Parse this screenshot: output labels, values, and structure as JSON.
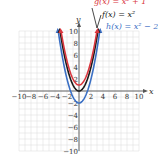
{
  "chart_data": {
    "type": "line",
    "title": "",
    "xlabel": "x",
    "ylabel": "y",
    "xlim": [
      -10,
      10
    ],
    "ylim": [
      -10,
      10
    ],
    "grid": true,
    "x_ticks": [
      "-10",
      "-8",
      "-6",
      "-4",
      "-2",
      "2",
      "4",
      "6",
      "8",
      "10"
    ],
    "y_ticks": [
      "10",
      "8",
      "6",
      "4",
      "2",
      "-2",
      "-4",
      "-6",
      "-8",
      "-10"
    ],
    "series": [
      {
        "name": "g(x) = x^2 + 1",
        "color": "#d9363e",
        "x": [
          -3,
          -2,
          -1,
          0,
          1,
          2,
          3
        ],
        "values": [
          10,
          5,
          2,
          1,
          2,
          5,
          10
        ]
      },
      {
        "name": "f(x) = x^2",
        "color": "#1a1a1a",
        "x": [
          -3,
          -2,
          -1,
          0,
          1,
          2,
          3
        ],
        "values": [
          9,
          4,
          1,
          0,
          1,
          4,
          9
        ]
      },
      {
        "name": "h(x) = x^2 - 2",
        "color": "#3a6fc4",
        "x": [
          -3,
          -2,
          -1,
          0,
          1,
          2,
          3
        ],
        "values": [
          7,
          2,
          -1,
          -2,
          -1,
          2,
          7
        ]
      }
    ]
  },
  "labels": {
    "g": "g(x) = x² + 1",
    "f": "f(x) = x²",
    "h": "h(x) = x² − 2",
    "x_axis": "x",
    "y_axis": "y"
  },
  "colors": {
    "g": "#d9363e",
    "f": "#1a1a1a",
    "h": "#3a6fc4",
    "grid": "#d8d8d8",
    "axis": "#555555"
  }
}
